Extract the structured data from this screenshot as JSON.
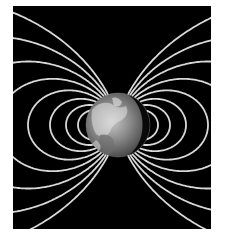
{
  "figure": {
    "background_color": "#000000",
    "page_color": "#ffffff",
    "field_line_color": "#d8d8d8",
    "planet": {
      "name": "Earth",
      "cx": 118,
      "cy": 125,
      "r": 32
    }
  }
}
